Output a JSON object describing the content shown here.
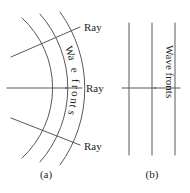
{
  "figure": {
    "background_color": "#ffffff",
    "stroke_color": "#58585a",
    "text_color": "#231f20"
  },
  "panel_a": {
    "caption": "(a)",
    "wavefront_label": "Wave fronts",
    "wavefront_label_chars": [
      "W",
      "a",
      "v",
      "e",
      " ",
      "f",
      "r",
      "o",
      "n",
      "t",
      "s"
    ],
    "type": "spherical-wavefronts",
    "arc_count": 3,
    "ray_count": 3,
    "rays": [
      {
        "name": "ray-upper",
        "label": "Ray"
      },
      {
        "name": "ray-middle",
        "label": "Ray"
      },
      {
        "name": "ray-lower",
        "label": "Ray"
      }
    ]
  },
  "panel_b": {
    "caption": "(b)",
    "wavefront_label": "Wave fronts",
    "wavefront_label_chars": [
      "W",
      "a",
      "v",
      "e",
      " ",
      "f",
      "r",
      "o",
      "n",
      "t",
      "s"
    ],
    "type": "plane-wavefronts",
    "line_count": 3,
    "ray_count": 1,
    "rays": [
      {
        "name": "ray-middle",
        "label": ""
      }
    ]
  }
}
